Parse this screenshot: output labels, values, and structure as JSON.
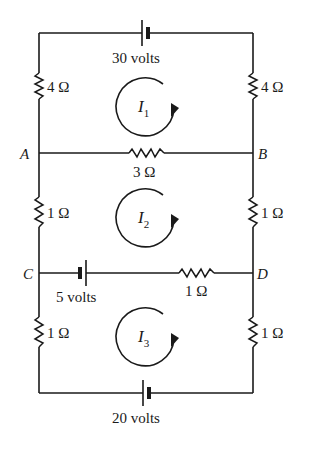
{
  "diagram": {
    "type": "electrical-circuit",
    "nodes": {
      "A": "A",
      "B": "B",
      "C": "C",
      "D": "D"
    },
    "batteries": {
      "top": "30 volts",
      "middle": "5 volts",
      "bottom": "20 volts"
    },
    "resistors": {
      "top_left": "4 Ω",
      "top_right": "4 Ω",
      "ab_branch": "3 Ω",
      "mid_left": "1 Ω",
      "mid_right": "1 Ω",
      "cd_branch": "1 Ω",
      "bottom_left": "1 Ω",
      "bottom_right": "1 Ω"
    },
    "loop_currents": [
      {
        "symbol": "I",
        "subscript": "1",
        "direction": "clockwise"
      },
      {
        "symbol": "I",
        "subscript": "2",
        "direction": "clockwise"
      },
      {
        "symbol": "I",
        "subscript": "3",
        "direction": "clockwise"
      }
    ],
    "colors": {
      "ink": "#1a1a1a",
      "background": "#ffffff"
    }
  }
}
